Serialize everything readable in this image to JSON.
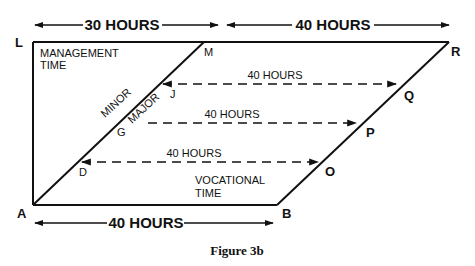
{
  "figure": {
    "caption": "Figure 3b",
    "dimensions": {
      "top_left": "30 HOURS",
      "top_right": "40 HOURS",
      "bottom": "40 HOURS"
    },
    "regions": {
      "management_line1": "MANAGEMENT",
      "management_line2": "TIME",
      "vocational_line1": "VOCATIONAL",
      "vocational_line2": "TIME",
      "minor": "MINOR",
      "major": "MAJOR"
    },
    "points": {
      "L": "L",
      "M": "M",
      "R": "R",
      "A": "A",
      "B": "B",
      "J": "J",
      "G": "G",
      "D": "D",
      "Q": "Q",
      "P": "P",
      "O": "O"
    },
    "transfers": [
      {
        "from": "J",
        "to": "Q",
        "label": "40 HOURS"
      },
      {
        "from": "G",
        "to": "P",
        "label": "40 HOURS"
      },
      {
        "from": "D",
        "to": "O",
        "label": "40 HOURS"
      }
    ],
    "colors": {
      "ink": "#111111",
      "background": "#ffffff"
    }
  }
}
